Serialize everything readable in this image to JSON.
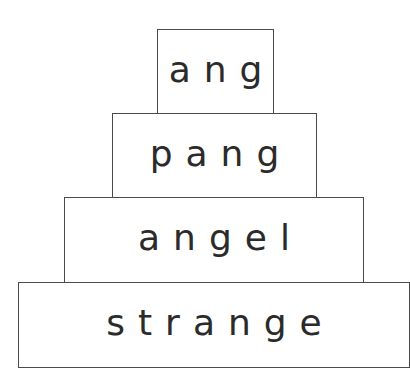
{
  "pyramid": {
    "rows": [
      {
        "word": "ang"
      },
      {
        "word": "pang"
      },
      {
        "word": "angel"
      },
      {
        "word": "strange"
      }
    ]
  }
}
